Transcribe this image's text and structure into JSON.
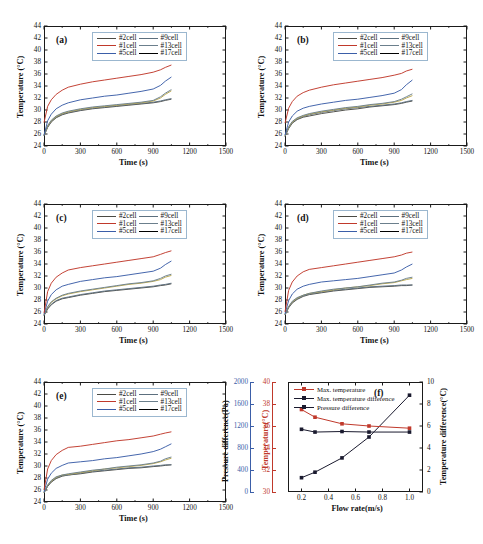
{
  "figure": {
    "width": 483,
    "height": 544,
    "panel_count": 6
  },
  "colors": {
    "cell_2": "#4a4a44",
    "cell_1": "#c0392b",
    "cell_5": "#3b5ea8",
    "cell_9": "#5c6f7e",
    "cell_13": "#6b7f8c",
    "cell_17": "#b8a martin",
    "cell_17_hex": "#b9a64a",
    "max_temperature": "#c0392b",
    "max_temperature_difference": "#1a1a2e",
    "pressure_difference": "#1a1a2e",
    "pressure_axis": "#3b5ea8",
    "temperature_axis": "#c0392b",
    "frame": "#1a1a1a",
    "legend_border": "#9bb7cf"
  },
  "common": {
    "xlabel": "Time (s)",
    "ylabel": "Temperature (°C)",
    "xticks": [
      0,
      300,
      600,
      900,
      1200,
      1500
    ],
    "yticks": [
      24,
      26,
      28,
      30,
      32,
      34,
      36,
      38,
      40,
      42,
      44
    ],
    "xlim": [
      0,
      1500
    ],
    "ylim": [
      24,
      44
    ],
    "legend": [
      {
        "label": "#2cell",
        "color_key": "cell_2"
      },
      {
        "label": "#9cell",
        "color_key": "cell_9"
      },
      {
        "label": "#1cell",
        "color_key": "cell_1"
      },
      {
        "label": "#13cell",
        "color_key": "cell_13"
      },
      {
        "label": "#5cell",
        "color_key": "cell_5"
      },
      {
        "label": "#17cell",
        "color_key": "cell_17"
      }
    ]
  },
  "chart_data": [
    {
      "id": "a",
      "type": "line",
      "panel_label": "(a)",
      "title": "",
      "xlabel": "Time (s)",
      "ylabel": "Temperature (°C)",
      "xlim": [
        0,
        1500
      ],
      "ylim": [
        24,
        44
      ],
      "xticks": [
        0,
        300,
        600,
        900,
        1200,
        1500
      ],
      "yticks": [
        24,
        26,
        28,
        30,
        32,
        34,
        36,
        38,
        40,
        42,
        44
      ],
      "grid": false,
      "legend_position": "top-center",
      "x": [
        0,
        30,
        60,
        100,
        150,
        200,
        300,
        400,
        500,
        600,
        700,
        800,
        900,
        960,
        1000,
        1050
      ],
      "series": [
        {
          "name": "#1cell",
          "color": "#c0392b",
          "values": [
            27.9,
            30.6,
            31.7,
            32.6,
            33.3,
            33.8,
            34.3,
            34.7,
            35.0,
            35.3,
            35.6,
            35.9,
            36.3,
            36.7,
            37.1,
            37.5
          ]
        },
        {
          "name": "#5cell",
          "color": "#3b5ea8",
          "values": [
            25.8,
            28.2,
            29.3,
            30.2,
            30.8,
            31.2,
            31.7,
            32.0,
            32.3,
            32.5,
            32.8,
            33.1,
            33.5,
            34.1,
            34.8,
            35.5
          ]
        },
        {
          "name": "#13cell",
          "color": "#6b7f8c",
          "values": [
            25.9,
            27.4,
            28.3,
            29.0,
            29.5,
            29.8,
            30.2,
            30.5,
            30.7,
            30.9,
            31.1,
            31.3,
            31.6,
            32.2,
            32.8,
            33.4
          ]
        },
        {
          "name": "#17cell",
          "color": "#b9a64a",
          "values": [
            25.8,
            27.3,
            28.2,
            28.9,
            29.4,
            29.7,
            30.1,
            30.4,
            30.6,
            30.8,
            31.0,
            31.2,
            31.5,
            32.0,
            32.6,
            33.2
          ]
        },
        {
          "name": "#9cell",
          "color": "#5c6f7e",
          "values": [
            25.7,
            27.2,
            28.1,
            28.8,
            29.3,
            29.6,
            30.0,
            30.3,
            30.5,
            30.7,
            30.9,
            31.1,
            31.3,
            31.5,
            31.7,
            31.9
          ]
        },
        {
          "name": "#2cell",
          "color": "#4a4a44",
          "values": [
            25.7,
            27.1,
            28.0,
            28.7,
            29.2,
            29.5,
            29.9,
            30.2,
            30.4,
            30.6,
            30.8,
            31.0,
            31.2,
            31.4,
            31.6,
            31.8
          ]
        }
      ]
    },
    {
      "id": "b",
      "type": "line",
      "panel_label": "(b)",
      "title": "",
      "xlabel": "Time (s)",
      "ylabel": "Temperature (°C)",
      "xlim": [
        0,
        1500
      ],
      "ylim": [
        24,
        44
      ],
      "xticks": [
        0,
        300,
        600,
        900,
        1200,
        1500
      ],
      "yticks": [
        24,
        26,
        28,
        30,
        32,
        34,
        36,
        38,
        40,
        42,
        44
      ],
      "grid": false,
      "legend_position": "top-center",
      "x": [
        0,
        30,
        60,
        100,
        150,
        200,
        300,
        400,
        500,
        600,
        700,
        800,
        900,
        960,
        1000,
        1050
      ],
      "series": [
        {
          "name": "#1cell",
          "color": "#c0392b",
          "values": [
            27.8,
            30.3,
            31.4,
            32.3,
            32.9,
            33.3,
            33.8,
            34.2,
            34.5,
            34.8,
            35.1,
            35.4,
            35.8,
            36.1,
            36.5,
            36.8
          ]
        },
        {
          "name": "#5cell",
          "color": "#3b5ea8",
          "values": [
            25.8,
            28.0,
            29.0,
            29.8,
            30.3,
            30.6,
            31.0,
            31.3,
            31.6,
            31.8,
            32.1,
            32.4,
            32.8,
            33.4,
            34.2,
            35.0
          ]
        },
        {
          "name": "#13cell",
          "color": "#6b7f8c",
          "values": [
            25.8,
            27.2,
            28.1,
            28.7,
            29.1,
            29.4,
            29.8,
            30.1,
            30.4,
            30.6,
            30.9,
            31.1,
            31.4,
            31.8,
            32.2,
            32.7
          ]
        },
        {
          "name": "#17cell",
          "color": "#b9a64a",
          "values": [
            25.7,
            27.1,
            28.0,
            28.6,
            29.0,
            29.3,
            29.7,
            30.0,
            30.3,
            30.5,
            30.8,
            31.0,
            31.3,
            31.6,
            32.0,
            32.4
          ]
        },
        {
          "name": "#9cell",
          "color": "#5c6f7e",
          "values": [
            25.6,
            27.0,
            27.9,
            28.5,
            28.9,
            29.2,
            29.6,
            29.9,
            30.2,
            30.4,
            30.6,
            30.8,
            31.0,
            31.2,
            31.4,
            31.6
          ]
        },
        {
          "name": "#2cell",
          "color": "#4a4a44",
          "values": [
            25.6,
            26.9,
            27.8,
            28.4,
            28.8,
            29.0,
            29.4,
            29.7,
            30.0,
            30.2,
            30.5,
            30.7,
            30.9,
            31.1,
            31.3,
            31.5
          ]
        }
      ]
    },
    {
      "id": "c",
      "type": "line",
      "panel_label": "(c)",
      "title": "",
      "xlabel": "Time (s)",
      "ylabel": "Temperature (°C)",
      "xlim": [
        0,
        1500
      ],
      "ylim": [
        24,
        44
      ],
      "xticks": [
        0,
        300,
        600,
        900,
        1200,
        1500
      ],
      "yticks": [
        24,
        26,
        28,
        30,
        32,
        34,
        36,
        38,
        40,
        42,
        44
      ],
      "grid": false,
      "legend_position": "top-center",
      "x": [
        0,
        30,
        60,
        100,
        150,
        200,
        300,
        400,
        500,
        600,
        700,
        800,
        900,
        960,
        1000,
        1050
      ],
      "series": [
        {
          "name": "#1cell",
          "color": "#c0392b",
          "values": [
            25.8,
            29.4,
            30.8,
            31.8,
            32.5,
            33.0,
            33.4,
            33.7,
            34.0,
            34.3,
            34.6,
            34.9,
            35.2,
            35.6,
            35.9,
            36.2
          ]
        },
        {
          "name": "#5cell",
          "color": "#3b5ea8",
          "values": [
            25.6,
            27.8,
            28.9,
            29.7,
            30.3,
            30.6,
            31.1,
            31.4,
            31.7,
            31.9,
            32.2,
            32.5,
            32.8,
            33.3,
            33.9,
            34.5
          ]
        },
        {
          "name": "#13cell",
          "color": "#6b7f8c",
          "values": [
            25.5,
            26.9,
            27.7,
            28.3,
            28.8,
            29.1,
            29.5,
            29.8,
            30.1,
            30.4,
            30.7,
            30.9,
            31.2,
            31.6,
            32.0,
            32.3
          ]
        },
        {
          "name": "#17cell",
          "color": "#b9a64a",
          "values": [
            25.5,
            26.8,
            27.6,
            28.2,
            28.7,
            29.0,
            29.4,
            29.7,
            30.0,
            30.3,
            30.6,
            30.8,
            31.1,
            31.4,
            31.8,
            32.1
          ]
        },
        {
          "name": "#9cell",
          "color": "#5c6f7e",
          "values": [
            25.4,
            26.6,
            27.3,
            27.9,
            28.3,
            28.5,
            28.9,
            29.2,
            29.5,
            29.7,
            29.9,
            30.1,
            30.3,
            30.5,
            30.6,
            30.8
          ]
        },
        {
          "name": "#2cell",
          "color": "#4a4a44",
          "values": [
            25.4,
            26.5,
            27.2,
            27.8,
            28.2,
            28.4,
            28.8,
            29.1,
            29.4,
            29.6,
            29.8,
            30.0,
            30.2,
            30.4,
            30.5,
            30.7
          ]
        }
      ]
    },
    {
      "id": "d",
      "type": "line",
      "panel_label": "(d)",
      "title": "",
      "xlabel": "Time (s)",
      "ylabel": "Temperature (°C)",
      "xlim": [
        0,
        1500
      ],
      "ylim": [
        24,
        44
      ],
      "xticks": [
        0,
        300,
        600,
        900,
        1200,
        1500
      ],
      "yticks": [
        24,
        26,
        28,
        30,
        32,
        34,
        36,
        38,
        40,
        42,
        44
      ],
      "grid": false,
      "legend_position": "top-center",
      "x": [
        0,
        30,
        60,
        100,
        150,
        200,
        300,
        400,
        500,
        600,
        700,
        800,
        900,
        960,
        1000,
        1050
      ],
      "series": [
        {
          "name": "#1cell",
          "color": "#c0392b",
          "values": [
            26.0,
            29.6,
            31.0,
            32.0,
            32.7,
            33.1,
            33.4,
            33.7,
            34.0,
            34.3,
            34.6,
            34.9,
            35.2,
            35.5,
            35.8,
            36.0
          ]
        },
        {
          "name": "#5cell",
          "color": "#3b5ea8",
          "values": [
            25.7,
            27.9,
            29.0,
            29.8,
            30.3,
            30.6,
            31.0,
            31.2,
            31.4,
            31.6,
            31.9,
            32.2,
            32.5,
            33.0,
            33.5,
            34.0
          ]
        },
        {
          "name": "#13cell",
          "color": "#6b7f8c",
          "values": [
            25.6,
            26.9,
            27.8,
            28.4,
            28.8,
            29.1,
            29.5,
            29.8,
            30.0,
            30.2,
            30.5,
            30.8,
            31.0,
            31.3,
            31.6,
            31.8
          ]
        },
        {
          "name": "#17cell",
          "color": "#b9a64a",
          "values": [
            25.6,
            26.9,
            27.7,
            28.3,
            28.8,
            29.1,
            29.4,
            29.7,
            30.0,
            30.2,
            30.4,
            30.7,
            30.9,
            31.2,
            31.4,
            31.6
          ]
        },
        {
          "name": "#9cell",
          "color": "#5c6f7e",
          "values": [
            25.5,
            26.8,
            27.6,
            28.2,
            28.7,
            29.0,
            29.3,
            29.6,
            29.8,
            30.0,
            30.2,
            30.3,
            30.4,
            30.5,
            30.5,
            30.5
          ]
        },
        {
          "name": "#2cell",
          "color": "#4a4a44",
          "values": [
            25.5,
            26.7,
            27.5,
            28.1,
            28.6,
            28.9,
            29.2,
            29.5,
            29.7,
            29.9,
            30.1,
            30.2,
            30.3,
            30.4,
            30.4,
            30.5
          ]
        }
      ]
    },
    {
      "id": "e",
      "type": "line",
      "panel_label": "(e)",
      "title": "",
      "xlabel": "Time (s)",
      "ylabel": "Temperature (°C)",
      "xlim": [
        0,
        1500
      ],
      "ylim": [
        24,
        44
      ],
      "xticks": [
        0,
        300,
        600,
        900,
        1200,
        1500
      ],
      "yticks": [
        24,
        26,
        28,
        30,
        32,
        34,
        36,
        38,
        40,
        42,
        44
      ],
      "grid": false,
      "legend_position": "top-center",
      "x": [
        0,
        30,
        60,
        100,
        150,
        200,
        300,
        400,
        500,
        600,
        700,
        800,
        900,
        960,
        1000,
        1050
      ],
      "series": [
        {
          "name": "#1cell",
          "color": "#c0392b",
          "values": [
            26.0,
            29.5,
            30.9,
            31.9,
            32.6,
            33.1,
            33.3,
            33.6,
            33.9,
            34.2,
            34.4,
            34.7,
            35.0,
            35.3,
            35.5,
            35.7
          ]
        },
        {
          "name": "#5cell",
          "color": "#3b5ea8",
          "values": [
            25.7,
            27.8,
            28.8,
            29.6,
            30.1,
            30.5,
            30.7,
            30.9,
            31.2,
            31.4,
            31.7,
            32.0,
            32.4,
            32.8,
            33.2,
            33.7
          ]
        },
        {
          "name": "#13cell",
          "color": "#6b7f8c",
          "values": [
            25.6,
            26.8,
            27.6,
            28.2,
            28.5,
            28.7,
            29.0,
            29.3,
            29.5,
            29.8,
            30.0,
            30.2,
            30.5,
            30.8,
            31.2,
            31.5
          ]
        },
        {
          "name": "#17cell",
          "color": "#b9a64a",
          "values": [
            25.6,
            26.8,
            27.5,
            28.1,
            28.5,
            28.6,
            28.9,
            29.2,
            29.5,
            29.7,
            29.9,
            30.1,
            30.4,
            30.7,
            31.0,
            31.3
          ]
        },
        {
          "name": "#9cell",
          "color": "#5c6f7e",
          "values": [
            25.5,
            26.7,
            27.4,
            28.0,
            28.4,
            28.5,
            28.8,
            29.1,
            29.3,
            29.5,
            29.7,
            29.8,
            30.0,
            30.1,
            30.2,
            30.2
          ]
        },
        {
          "name": "#2cell",
          "color": "#4a4a44",
          "values": [
            25.5,
            26.6,
            27.3,
            27.9,
            28.3,
            28.5,
            28.7,
            29.0,
            29.2,
            29.4,
            29.6,
            29.7,
            29.9,
            30.0,
            30.1,
            30.2
          ]
        }
      ]
    },
    {
      "id": "f",
      "type": "line",
      "panel_label": "(f)",
      "title": "",
      "xlabel": "Flow rate(m/s)",
      "ylabel_left_outer": "Pressure difference(Pa)",
      "ylabel_left_inner": "Temperature(°C)",
      "ylabel_right": "Temperature difference(°C)",
      "xlim": [
        0.1,
        1.1
      ],
      "xticks": [
        0.2,
        0.4,
        0.6,
        0.8,
        1.0
      ],
      "pressure_lim": [
        0,
        2000
      ],
      "pressure_ticks": [
        0,
        400,
        800,
        1200,
        1600,
        2000
      ],
      "temperature_lim": [
        30,
        40
      ],
      "temperature_ticks": [
        30,
        32,
        34,
        36,
        38,
        40
      ],
      "tempdiff_lim": [
        0,
        10
      ],
      "tempdiff_ticks": [
        0,
        2,
        4,
        6,
        8,
        10
      ],
      "grid": false,
      "legend_position": "top-left",
      "x": [
        0.2,
        0.3,
        0.5,
        0.7,
        1.0
      ],
      "series": [
        {
          "name": "Max. temperature",
          "color": "#c0392b",
          "axis": "temperature",
          "values": [
            37.5,
            36.8,
            36.2,
            36.0,
            35.8
          ]
        },
        {
          "name": "Max. temperature difference",
          "color": "#1a1a2e",
          "axis": "tempdiff",
          "values": [
            1.3,
            1.8,
            3.1,
            5.0,
            8.8
          ]
        },
        {
          "name": "Pressure difference",
          "color": "#1a1a2e",
          "axis": "pressure",
          "values": [
            1140,
            1090,
            1100,
            1090,
            1090
          ]
        }
      ]
    }
  ]
}
